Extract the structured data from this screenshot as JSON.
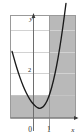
{
  "figure": {
    "top_strip_text": "",
    "background_color": "#ffffff",
    "frame_color": "#9a9a9a",
    "grid_color": "#cfcfcf",
    "axis_color": "#707070",
    "curve_color": "#1a1a1a",
    "shade_color": "#b9b9b9",
    "label_color": "#303030"
  },
  "chart_data": {
    "type": "line",
    "title": "",
    "subtitle": "",
    "xlabel": "x",
    "ylabel": "y",
    "grid": true,
    "legend": null,
    "xlim": [
      -1.5,
      2.6
    ],
    "ylim": [
      -1.0,
      5.4
    ],
    "x_ticks": [
      {
        "value": 0,
        "label": "0"
      },
      {
        "value": 1,
        "label": "1"
      }
    ],
    "y_ticks": [
      {
        "value": 2,
        "label": "2"
      }
    ],
    "axis_arrow_labels": {
      "x_axis_end": "x",
      "y_axis_end": "y"
    },
    "gridlines": {
      "horizontal_values": [
        1,
        2,
        3,
        4
      ],
      "vertical_values": [
        1
      ]
    },
    "series": [
      {
        "name": "parabola",
        "type": "line",
        "x": [
          -1.4,
          -1.2,
          -1.0,
          -0.8,
          -0.6,
          -0.4,
          -0.2,
          0.0,
          0.2,
          0.3,
          0.4,
          0.6,
          0.8,
          1.0,
          1.2,
          1.4,
          1.6,
          1.8,
          2.0,
          2.2,
          2.4,
          2.5
        ],
        "values": [
          3.16,
          2.44,
          1.8,
          1.24,
          0.76,
          0.36,
          0.04,
          -0.2,
          -0.36,
          -0.39,
          -0.4,
          -0.28,
          0.04,
          0.56,
          1.28,
          2.2,
          3.32,
          4.64,
          6.16,
          7.88,
          9.8,
          10.85
        ]
      }
    ],
    "shaded_regions": [
      {
        "name": "vertical-band",
        "x_range": [
          1,
          2.5
        ],
        "y_range": [
          -1.0,
          5.4
        ]
      },
      {
        "name": "horizontal-band",
        "x_range": [
          -1.5,
          1
        ],
        "y_range": [
          -1.0,
          1
        ]
      }
    ],
    "annotations": []
  }
}
